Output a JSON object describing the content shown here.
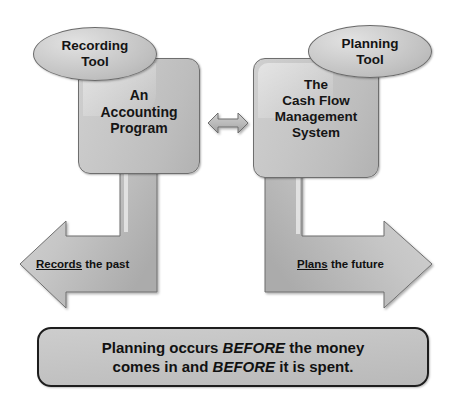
{
  "diagram": {
    "colors": {
      "shape_fill": "#c6c6c6",
      "shape_fill_light": "#d6d6d6",
      "shape_fill_dark": "#ababab",
      "shape_stroke": "#6e6e6e",
      "caption_stroke": "#1d1d1d",
      "text": "#141414",
      "background": "#ffffff"
    },
    "nodes": {
      "left_ellipse": {
        "label": "Recording\nTool",
        "shape": "ellipse"
      },
      "right_ellipse": {
        "label": "Planning\nTool",
        "shape": "ellipse"
      },
      "left_box": {
        "label": "An\nAccounting\nProgram",
        "shape": "rounded-rectangle"
      },
      "right_box": {
        "label": "The\nCash Flow\nManagement\nSystem",
        "shape": "rounded-rectangle"
      }
    },
    "connectors": {
      "center": {
        "name": "bidirectional-arrow",
        "direction": "both",
        "from": "left_box",
        "to": "right_box"
      },
      "left_arrow": {
        "name": "elbow-arrow-left",
        "direction": "down-then-left",
        "from": "left_box"
      },
      "right_arrow": {
        "name": "elbow-arrow-right",
        "direction": "down-then-right",
        "from": "right_box"
      }
    },
    "labels": {
      "left_arrow": {
        "underlined": "Records",
        "rest": " the past"
      },
      "right_arrow": {
        "underlined": "Plans",
        "rest": " the future"
      }
    },
    "caption": {
      "line1_a": "Planning occurs ",
      "line1_em": "BEFORE",
      "line1_b": " the money",
      "line2_a": "comes in and ",
      "line2_em": "BEFORE",
      "line2_b": " it is spent."
    }
  }
}
